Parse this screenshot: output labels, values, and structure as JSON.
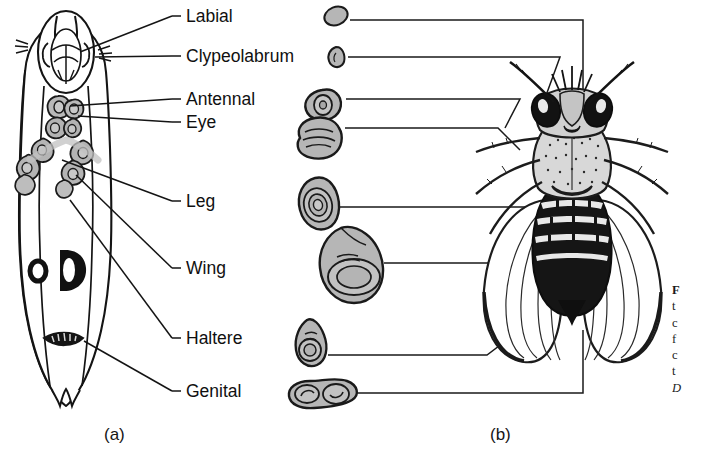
{
  "figure": {
    "type": "two-panel-biology-diagram",
    "panels": [
      {
        "id": "a",
        "label": "(a)",
        "content": "third-instar larva showing locations of imaginal discs"
      },
      {
        "id": "b",
        "label": "(b)",
        "content": "isolated imaginal discs linked to adult fly structures"
      }
    ]
  },
  "panel_a": {
    "label": "(a)",
    "organism": "drosophila-larva",
    "callouts": [
      {
        "name": "labial",
        "label": "Labial"
      },
      {
        "name": "clypeolabrum",
        "label": "Clypeolabrum"
      },
      {
        "name": "antennal",
        "label": "Antennal"
      },
      {
        "name": "eye",
        "label": "Eye"
      },
      {
        "name": "leg",
        "label": "Leg"
      },
      {
        "name": "wing",
        "label": "Wing"
      },
      {
        "name": "haltere",
        "label": "Haltere"
      },
      {
        "name": "genital",
        "label": "Genital"
      }
    ],
    "larva_markings": [
      "anterior-spiracle-ring",
      "dorsal-D-marking",
      "posterior-spiracle-patch"
    ]
  },
  "panel_b": {
    "label": "(b)",
    "adult": "drosophila-melanogaster-adult-dorsal-view",
    "discs": [
      {
        "name": "labial-disc",
        "shape": "small-oval"
      },
      {
        "name": "clypeolabrum-disc",
        "shape": "small-teardrop"
      },
      {
        "name": "antennal-disc",
        "shape": "lobed-folded"
      },
      {
        "name": "eye-disc",
        "shape": "broad-lobed"
      },
      {
        "name": "leg-disc",
        "shape": "concentric-oval"
      },
      {
        "name": "wing-disc",
        "shape": "large-teardrop-concentric"
      },
      {
        "name": "haltere-disc",
        "shape": "small-teardrop-concentric"
      },
      {
        "name": "genital-disc",
        "shape": "bilobed"
      }
    ]
  },
  "caption": {
    "clipped": true,
    "visible_fragments": [
      "F",
      "t",
      "c",
      "f",
      "c",
      "t",
      "D"
    ]
  },
  "colors": {
    "ink": "#101010",
    "disc_fill": "#b0b0b0",
    "disc_fill_light": "#c4c4c4",
    "paper": "#ffffff",
    "caption_ink": "#1a1a1a"
  }
}
